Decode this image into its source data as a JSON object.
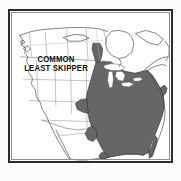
{
  "figure": {
    "kind": "range-map",
    "subject_label_lines": [
      "COMMON",
      "LEAST SKIPPER"
    ],
    "region": "North America",
    "frame": {
      "border_color": "#2b2b2b",
      "inner_hairline_color": "#8f8f8f",
      "fill_color": "#ffffff"
    },
    "page_background": "#fbfbfb"
  },
  "legend": {
    "range_fill_color": "#666666",
    "range_outline_color": "#1d1d1d",
    "political_line_color": "#8a8a8a",
    "coastline_color": "#4a4a4a",
    "meaning": "shaded area indicates the species distribution"
  },
  "map_geometry": {
    "coastlines": {
      "pacific_northwest_and_california": "M 12,26 L 14,30 L 13,34 L 17,37 L 16,41 L 19,44 L 18,48 L 21,52 L 20,57 L 24,62 L 23,68 L 27,74 L 26,80 L 30,86 L 31,93 L 35,99 L 37,106 L 41,112 L 44,119 L 48,126 L 52,133 L 55,140 L 58,147",
      "baja_peninsula": "M 44,119 L 46,126 L 49,133 L 53,140 L 57,147 L 60,152 L 58,153 L 53,146 L 49,139 L 45,131 L 42,123 Z",
      "gulf_of_california_inner": "M 47,121 L 51,129 L 55,137 L 59,145 L 62,150",
      "mexico_south": "M 62,150 L 70,152 L 78,152 L 86,151 L 93,150 L 99,151 L 104,152",
      "gulf_coast": "M 104,152 L 110,150 L 116,149 L 122,148 L 128,148 L 134,149 L 140,150",
      "florida": "M 140,150 L 143,144 L 145,138 L 147,132 L 149,127",
      "atlantic_coast": "M 149,127 L 152,121 L 154,115 L 156,109 L 157,103 L 158,97 L 157,91 L 155,86 L 152,81 L 149,76 L 146,71 L 143,66 L 141,61",
      "northeast_maritimes": "M 141,61 L 145,58 L 150,56 L 155,55 L 159,56 L 160,52 L 157,49 L 152,48 L 147,49 L 143,52",
      "hudson_bay": "M 104,21 L 100,27 L 99,34 L 101,41 L 106,46 L 113,48 L 120,46 L 125,41 L 127,34 L 125,27 L 120,22 L 112,20 Z",
      "arctic_north": "M 12,24 L 22,21 L 34,19 L 48,18 L 62,17 L 76,17 L 90,18 L 100,20 L 110,19 L 120,18 L 132,19 L 144,21 L 154,24 L 160,27",
      "canadian_islands": "M 56,26 L 66,24 L 76,25 L 80,28 L 72,30 L 62,30 Z",
      "baffin": "M 130,22 L 140,20 L 150,23 L 156,29 L 152,34 L 144,33 L 136,28 Z",
      "greenland_edge": "M 158,30 L 162,36 L 162,44 L 159,50"
    },
    "political_lines": {
      "us_canada_border_49th": "M 12,47 L 30,48 L 50,49 L 70,50 L 90,51 L 104,52",
      "great_lakes_border": "M 104,52 L 110,58 L 118,62 L 128,64 L 136,62 L 141,61",
      "prairie_vertical_1": "M 36,22 L 38,48",
      "prairie_vertical_2": "M 58,20 L 60,49",
      "prairie_vertical_3": "M 78,19 L 80,50",
      "us_interior_vertical_1": "M 27,52 L 29,92",
      "us_interior_vertical_2": "M 46,51 L 47,96",
      "us_interior_vertical_3": "M 62,50 L 63,104",
      "us_interior_vertical_4": "M 78,50 L 79,120",
      "us_interior_horizontal_1": "M 14,70 L 96,72",
      "us_interior_horizontal_2": "M 20,92 L 100,94",
      "us_interior_horizontal_3": "M 32,112 L 100,114",
      "mexico_interior": "M 52,128 L 70,126 L 86,126 L 96,130"
    },
    "range_polygons": {
      "main_eastern_block": "M 88,52 L 96,52 L 104,53 L 110,58 L 118,62 L 128,64 L 136,62 L 141,61 L 145,66 L 149,72 L 153,79 L 156,86 L 157,93 L 157,100 L 155,108 L 152,116 L 149,124 L 146,131 L 143,138 L 141,145 L 138,149 L 132,148 L 126,147 L 120,147 L 114,147 L 108,148 L 102,150 L 98,147 L 95,142 L 92,136 L 89,130 L 86,124 L 84,118 L 82,112 L 80,106 L 79,99 L 78,92 L 79,85 L 80,78 L 82,71 L 84,64 L 86,58 Z",
      "western_edge_notch": "M 78,92 L 72,93 L 68,97 L 70,102 L 76,104 L 80,106 Z",
      "upper_midwest_arm": "M 86,34 L 92,34 L 94,40 L 93,47 L 91,52 L 88,52 L 86,46 L 85,40 Z",
      "florida_peninsula": "M 141,145 L 144,139 L 146,133 L 148,128 L 150,131 L 149,137 L 147,143 L 145,148 L 142,150 Z",
      "gulf_coast_louisiana": "M 102,150 L 98,152 L 94,152 L 92,149 L 95,146 L 99,147 Z",
      "texas_east_extension": "M 84,118 L 80,121 L 78,126 L 80,131 L 84,133 L 88,130 L 89,124 Z",
      "new_england_tip": "M 153,79 L 157,76 L 160,78 L 159,83 L 156,86 Z"
    }
  }
}
